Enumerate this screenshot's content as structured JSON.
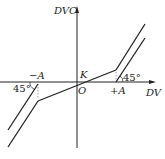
{
  "diagram": {
    "y_axis_label": "DVC",
    "x_axis_label": "DV",
    "origin_label": "O",
    "slope_label": "K",
    "neg_threshold_label": "−A",
    "pos_threshold_label": "+A",
    "left_angle_label": "45°",
    "right_angle_label": "45°",
    "colors": {
      "line": "#222222",
      "background": "#ffffff"
    }
  }
}
